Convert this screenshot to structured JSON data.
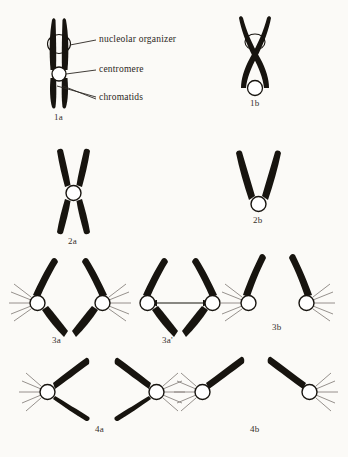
{
  "figure": {
    "background_color": "#fbfaf7",
    "ink_color": "#17140f",
    "centromere_fill": "#ffffff",
    "spindle_line_color": "#8a8580",
    "annotations": [
      {
        "id": "nucleolar-organizer",
        "text": "nucleolar organizer"
      },
      {
        "id": "centromere",
        "text": "centromere"
      },
      {
        "id": "chromatids",
        "text": "chromatids"
      }
    ],
    "panels": [
      {
        "id": "1a",
        "caption": "1a",
        "description": "paired parallel chromatids with nucleolar organizer and centromere",
        "centromeres": 1,
        "arms": 4,
        "spindle_fibers": false
      },
      {
        "id": "1b",
        "caption": "1b",
        "description": "crossed twisted chromatids with two constriction rings",
        "centromeres": 2,
        "arms": 4,
        "spindle_fibers": false
      },
      {
        "id": "2a",
        "caption": "2a",
        "description": "narrow X shaped chromosome with median centromere",
        "centromeres": 1,
        "arms": 4,
        "spindle_fibers": false
      },
      {
        "id": "2b",
        "caption": "2b",
        "description": "V shaped chromosome with terminal centromere",
        "centromeres": 1,
        "arms": 2,
        "spindle_fibers": false
      },
      {
        "id": "3a",
        "caption": "3a",
        "description": "two centromeres with four arms forming lens shape and spindle fibers",
        "centromeres": 2,
        "arms": 4,
        "spindle_fibers": true
      },
      {
        "id": "3a-prime",
        "caption": "3a'",
        "description": "same as 3a with double headed arrow between centromeres",
        "centromeres": 2,
        "arms": 4,
        "spindle_fibers": false,
        "arrow": "double-headed-horizontal"
      },
      {
        "id": "3b",
        "caption": "3b",
        "description": "two upper arms diverging from two centromeres with spindle fibers",
        "centromeres": 2,
        "arms": 2,
        "spindle_fibers": true
      },
      {
        "id": "4a",
        "caption": "4a",
        "description": "two mirrored V shaped chromosomes opening inward with spindle fibers",
        "centromeres": 2,
        "arms": 4,
        "spindle_fibers": true
      },
      {
        "id": "4b",
        "caption": "4b",
        "description": "two single diagonal arms pointing inward with spindle fibers",
        "centromeres": 2,
        "arms": 2,
        "spindle_fibers": true
      }
    ]
  }
}
